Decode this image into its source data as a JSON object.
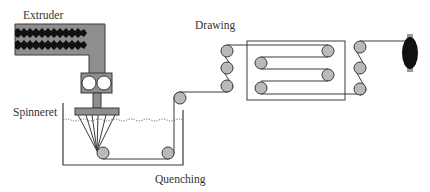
{
  "labels": {
    "extruder": "Extruder",
    "spinneret": "Spinneret",
    "quenching": "Quenching",
    "drawing": "Drawing"
  },
  "components": [
    {
      "name": "extruder",
      "description": "Screw extruder barrel"
    },
    {
      "name": "metering-pump",
      "description": "Gear pump with two gears"
    },
    {
      "name": "spinneret",
      "description": "Spinneret plate extruding filaments"
    },
    {
      "name": "quench-bath",
      "description": "Tank with water line and guide rollers"
    },
    {
      "name": "drawing-unit",
      "description": "Godet roller stacks and draw box with four rollers"
    },
    {
      "name": "take-up-bobbin",
      "description": "Winding bobbin"
    }
  ],
  "colors": {
    "metal": "#8e8e8e",
    "roller": "#b9b9b9",
    "line": "#3a3a3a",
    "bobbin": "#111111"
  }
}
